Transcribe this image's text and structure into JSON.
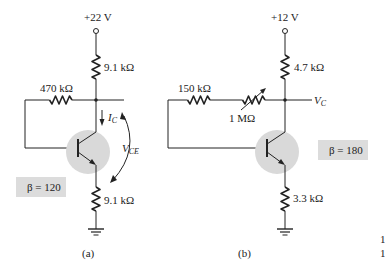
{
  "figure": {
    "circuits": [
      {
        "id": "a",
        "caption": "(a)",
        "supply": "+22 V",
        "rc": "9.1 kΩ",
        "rb": "470 kΩ",
        "re": "9.1 kΩ",
        "beta": "β = 120",
        "ic_label": "I",
        "ic_sub": "C",
        "vce_label": "V",
        "vce_sub": "CE"
      },
      {
        "id": "b",
        "caption": "(b)",
        "supply": "+12 V",
        "rc": "4.7 kΩ",
        "rb": "150 kΩ",
        "pot": "1 MΩ",
        "re": "3.3 kΩ",
        "beta": "β = 180",
        "vc_label": "V",
        "vc_sub": "C"
      }
    ],
    "edge_marks": [
      "1",
      "1"
    ],
    "colors": {
      "ink": "#222222",
      "transistor_highlight": "#d9d9d9",
      "beta_box": "#dcdcdc"
    }
  }
}
